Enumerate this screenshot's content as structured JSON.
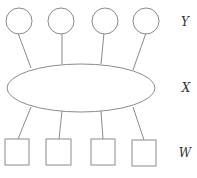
{
  "diagram": {
    "type": "layered-graph",
    "layers": [
      {
        "id": "Y",
        "label": "Y",
        "shape": "circle",
        "count": 4
      },
      {
        "id": "X",
        "label": "X",
        "shape": "ellipse",
        "count": 1
      },
      {
        "id": "W",
        "label": "W",
        "shape": "square",
        "count": 4
      }
    ],
    "colors": {
      "stroke": "#8a8a8a",
      "fill": "#ffffff",
      "label": "#333333"
    },
    "edges": [
      {
        "from": "Y1",
        "to": "X"
      },
      {
        "from": "Y2",
        "to": "X"
      },
      {
        "from": "Y3",
        "to": "X"
      },
      {
        "from": "Y4",
        "to": "X"
      },
      {
        "from": "X",
        "to": "W1"
      },
      {
        "from": "X",
        "to": "W2"
      },
      {
        "from": "X",
        "to": "W3"
      },
      {
        "from": "X",
        "to": "W4"
      }
    ]
  },
  "labels": {
    "y": "Y",
    "x": "X",
    "w": "W"
  }
}
